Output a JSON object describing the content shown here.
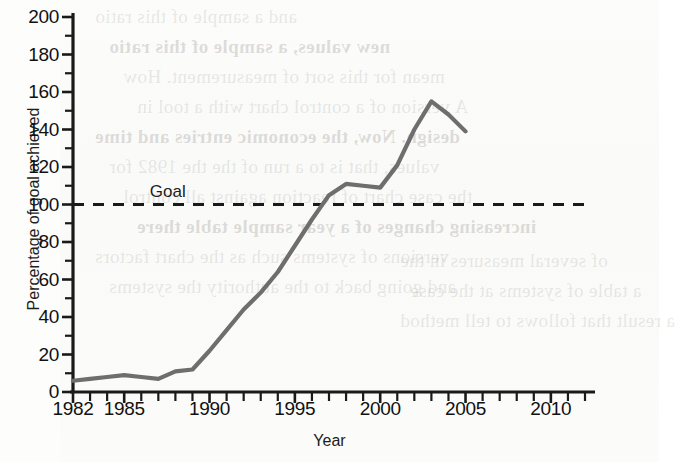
{
  "chart_data": {
    "type": "line",
    "title": "",
    "xlabel": "Year",
    "ylabel": "Percentage of goal achieved",
    "xlim": [
      1982,
      2012
    ],
    "ylim": [
      0,
      200
    ],
    "ytick_labels": [
      "0",
      "20",
      "40",
      "60",
      "80",
      "100",
      "120",
      "140",
      "160",
      "180",
      "200"
    ],
    "ytick_values": [
      0,
      20,
      40,
      60,
      80,
      100,
      120,
      140,
      160,
      180,
      200
    ],
    "ytick_minor_step": 10,
    "xtick_labels": [
      "1982",
      "1985",
      "1990",
      "1995",
      "2000",
      "2005",
      "2010"
    ],
    "xtick_values": [
      1982,
      1985,
      1990,
      1995,
      2000,
      2005,
      2010
    ],
    "xtick_minor_step": 1,
    "grid": false,
    "legend": "none",
    "line_color": "#6e6e6e",
    "axis_color": "#1a1a1a",
    "annotations": [
      {
        "name": "goal-line",
        "label": "Goal",
        "value": 100,
        "style": "dashed",
        "color": "#1a1a1a",
        "label_x": 1986.5
      }
    ],
    "x": [
      1982,
      1983,
      1984,
      1985,
      1986,
      1987,
      1988,
      1989,
      1990,
      1991,
      1992,
      1993,
      1994,
      1995,
      1996,
      1997,
      1998,
      1999,
      2000,
      2001,
      2002,
      2003,
      2004,
      2005
    ],
    "values": [
      6,
      7,
      8,
      9,
      8,
      7,
      11,
      12,
      22,
      33,
      44,
      53,
      64,
      78,
      92,
      105,
      111,
      110,
      109,
      121,
      140,
      155,
      148,
      139
    ],
    "series": [
      {
        "name": "Percentage of goal achieved",
        "values": [
          6,
          7,
          8,
          9,
          8,
          7,
          11,
          12,
          22,
          33,
          44,
          53,
          64,
          78,
          92,
          105,
          111,
          110,
          109,
          121,
          140,
          155,
          148,
          139
        ]
      }
    ]
  },
  "background_ghost_text": {
    "lines": [
      "and a sample of this ratio",
      "new values, a sample of this ratio",
      "mean for this sort of measurement. How",
      "A version of a control chart with a tool in",
      "design. Now, the economic entries and time",
      "values, that is to a run of the the 1982 for",
      "the case chart of reaction against all control",
      "increasing changes of a year sample table there",
      "versions of systems such as the chart factors",
      "and going back to the authority the systems"
    ],
    "lines_right": [
      "of several measures in the",
      "a table of systems at the case",
      "a result that follows to tell method"
    ]
  }
}
